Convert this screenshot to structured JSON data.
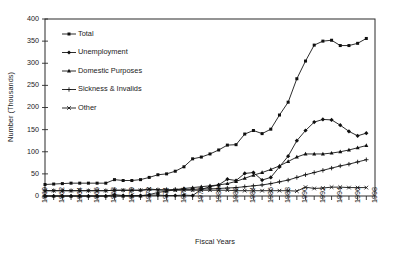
{
  "chart_data": {
    "type": "line",
    "title": "",
    "xlabel": "Fiscal Years",
    "ylabel": "Number (Thousands)",
    "ylim": [
      0,
      400
    ],
    "ytick_values": [
      0,
      50,
      100,
      150,
      200,
      250,
      300,
      350,
      400
    ],
    "ytick_labels": [
      "0",
      "50",
      "100",
      "150",
      "200",
      "250",
      "300",
      "350",
      "400"
    ],
    "xlim": [
      1960,
      1998
    ],
    "xtick_labels": [
      "1960",
      "1962",
      "1964",
      "1966",
      "1968",
      "1970",
      "1972",
      "1974",
      "1976",
      "1978",
      "1980",
      "1982",
      "1984",
      "1986",
      "1988",
      "1990",
      "1992",
      "1994",
      "1996",
      "1998"
    ],
    "minor_ticks_every_year": true,
    "grid": false,
    "legend_position": "upper-left-inside",
    "x": [
      1960,
      1961,
      1962,
      1963,
      1964,
      1965,
      1966,
      1967,
      1968,
      1969,
      1970,
      1971,
      1972,
      1973,
      1974,
      1975,
      1976,
      1977,
      1978,
      1979,
      1980,
      1981,
      1982,
      1983,
      1984,
      1985,
      1986,
      1987,
      1988,
      1989,
      1990,
      1991,
      1992,
      1993,
      1994,
      1995,
      1996,
      1997
    ],
    "series": [
      {
        "name": "Total",
        "marker": "square",
        "values": [
          26,
          27,
          28,
          29,
          29,
          29,
          29,
          29,
          37,
          35,
          35,
          37,
          42,
          48,
          50,
          56,
          66,
          84,
          88,
          95,
          104,
          115,
          116,
          140,
          148,
          141,
          151,
          183,
          212,
          265,
          305,
          341,
          350,
          352,
          340,
          340,
          345,
          356
        ]
      },
      {
        "name": "Unemployment",
        "marker": "diamond",
        "values": [
          0,
          0,
          0,
          0,
          0,
          0,
          0,
          0,
          3,
          1,
          1,
          1,
          2,
          2,
          1,
          1,
          2,
          1,
          15,
          21,
          25,
          38,
          35,
          51,
          53,
          36,
          42,
          66,
          90,
          125,
          148,
          167,
          173,
          172,
          160,
          146,
          136,
          142
        ]
      },
      {
        "name": "Domestic Purposes",
        "marker": "triangle",
        "values": [
          0,
          0,
          0,
          0,
          0,
          0,
          0,
          0,
          0,
          0,
          0,
          0,
          3,
          8,
          11,
          14,
          17,
          19,
          21,
          23,
          25,
          28,
          33,
          40,
          47,
          53,
          60,
          68,
          78,
          88,
          95,
          95,
          95,
          97,
          100,
          104,
          109,
          114
        ]
      },
      {
        "name": "Sickness & Invalids",
        "marker": "plus",
        "values": [
          12,
          12,
          12,
          12,
          12,
          12,
          12,
          12,
          13,
          13,
          13,
          13,
          14,
          14,
          14,
          15,
          15,
          15,
          16,
          16,
          17,
          18,
          19,
          21,
          23,
          25,
          28,
          32,
          36,
          42,
          48,
          53,
          58,
          63,
          68,
          72,
          77,
          82
        ]
      },
      {
        "name": "Other",
        "marker": "cross",
        "values": [
          12,
          12,
          12,
          12,
          12,
          12,
          12,
          12,
          13,
          13,
          13,
          13,
          16,
          14,
          13,
          13,
          13,
          13,
          13,
          13,
          13,
          13,
          12,
          12,
          12,
          12,
          12,
          12,
          12,
          11,
          20,
          17,
          18,
          20,
          20,
          19,
          19,
          19
        ]
      }
    ]
  },
  "legend": {
    "entries": [
      {
        "label": "Total"
      },
      {
        "label": "Unemployment"
      },
      {
        "label": "Domestic Purposes"
      },
      {
        "label": "Sickness & Invalids"
      },
      {
        "label": "Other"
      }
    ]
  },
  "colors": {
    "ink": "#151515",
    "axis": "#2b2b2b",
    "background": "#ffffff"
  }
}
